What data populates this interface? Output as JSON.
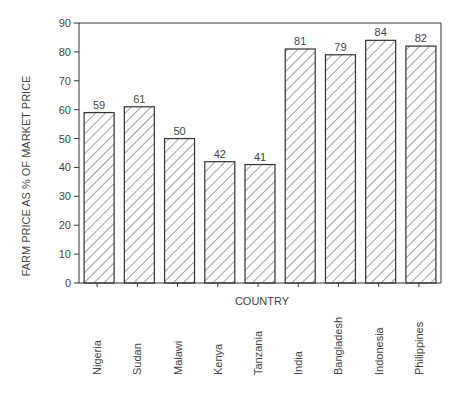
{
  "chart_data": {
    "type": "bar",
    "title": "",
    "xlabel": "COUNTRY",
    "ylabel": "FARM PRICE AS % OF MARKET PRICE",
    "categories": [
      "Nigeria",
      "Sudan",
      "Malawi",
      "Kenya",
      "Tanzania",
      "India",
      "Bangladesh",
      "Indonesia",
      "Philippines"
    ],
    "values": [
      59,
      61,
      50,
      42,
      41,
      81,
      79,
      84,
      82
    ],
    "data_labels": [
      "59",
      "61",
      "50",
      "42",
      "41",
      "81",
      "79",
      "84",
      "82"
    ],
    "ylim": [
      0,
      90
    ],
    "yticks": [
      0,
      10,
      20,
      30,
      40,
      50,
      60,
      70,
      80,
      90
    ],
    "grid": false,
    "legend": null,
    "bar_fill": "diagonal hatching",
    "colors": {
      "stroke": "#333333",
      "background": "#ffffff"
    }
  }
}
